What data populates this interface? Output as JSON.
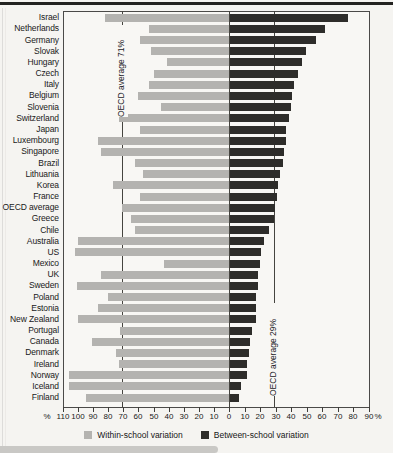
{
  "chart_data": {
    "type": "bar",
    "orientation": "horizontal-diverging",
    "title": "",
    "xlabel": "%",
    "axis_left_range": [
      0,
      110
    ],
    "axis_right_range": [
      0,
      90
    ],
    "tick_step": 10,
    "grid": false,
    "legend_position": "bottom",
    "categories": [
      "Israel",
      "Netherlands",
      "Germany",
      "Slovak",
      "Hungary",
      "Czech",
      "Italy",
      "Belgium",
      "Slovenia",
      "Switzerland",
      "Japan",
      "Luxembourg",
      "Singapore",
      "Brazil",
      "Lithuania",
      "Korea",
      "France",
      "OECD average",
      "Greece",
      "Chile",
      "Australia",
      "US",
      "Mexico",
      "UK",
      "Sweden",
      "Poland",
      "Estonia",
      "New Zealand",
      "Portugal",
      "Canada",
      "Denmark",
      "Ireland",
      "Norway",
      "Iceland",
      "Finland"
    ],
    "series": [
      {
        "name": "Within-school variation",
        "side": "left",
        "color": "#b4b3b0",
        "values": [
          82,
          53,
          59,
          52,
          41,
          50,
          53,
          60,
          45,
          73,
          59,
          87,
          85,
          62,
          57,
          77,
          59,
          71,
          65,
          62,
          100,
          102,
          43,
          85,
          101,
          80,
          87,
          100,
          72,
          91,
          75,
          73,
          106,
          106,
          95
        ]
      },
      {
        "name": "Between-school variation",
        "side": "right",
        "color": "#2e2d2a",
        "values": [
          76,
          61,
          55,
          49,
          46,
          44,
          41,
          40,
          39,
          38,
          36,
          36,
          35,
          34,
          32,
          31,
          30,
          29,
          28,
          25,
          22,
          20,
          19,
          18,
          18,
          17,
          17,
          17,
          14,
          13,
          12,
          11,
          11,
          7,
          6
        ]
      }
    ],
    "reference_lines": [
      {
        "label": "OECD average 71%",
        "side": "left",
        "value": 71
      },
      {
        "label": "OECD average 29%",
        "side": "right",
        "value": 29
      }
    ]
  },
  "axis": {
    "left_ticks": [
      110,
      100,
      90,
      80,
      70,
      60,
      50,
      40,
      30,
      20,
      10
    ],
    "zero_tick": "0",
    "right_ticks": [
      10,
      20,
      30,
      40,
      50,
      60,
      70,
      80,
      90
    ],
    "unit": "%"
  },
  "legend": [
    {
      "label": "Within-school variation",
      "color": "#b4b3b0"
    },
    {
      "label": "Between-school variation",
      "color": "#2e2d2a"
    }
  ]
}
